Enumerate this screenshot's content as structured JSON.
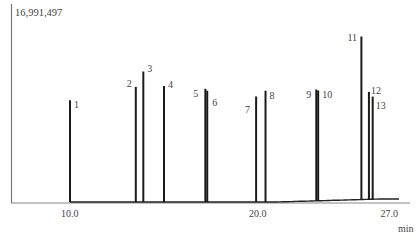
{
  "chart_data": {
    "type": "line",
    "title": "",
    "xlabel": "min",
    "ylabel": "",
    "y_max_label": "16,991,497",
    "xlim": [
      6.9,
      27.8
    ],
    "ylim": [
      0,
      16991497
    ],
    "grid": false,
    "legend": null,
    "x_ticks": [
      {
        "value": 10.0,
        "label": "10.0"
      },
      {
        "value": 20.0,
        "label": "20.0"
      },
      {
        "value": 27.0,
        "label": "27.0"
      }
    ],
    "peaks": [
      {
        "label": "1",
        "rt": 10.0,
        "height": 10600000
      },
      {
        "label": "2",
        "rt": 13.5,
        "height": 12000000
      },
      {
        "label": "3",
        "rt": 13.9,
        "height": 13600000
      },
      {
        "label": "4",
        "rt": 15.0,
        "height": 12100000
      },
      {
        "label": "5",
        "rt": 17.2,
        "height": 11800000
      },
      {
        "label": "6",
        "rt": 17.3,
        "height": 11600000
      },
      {
        "label": "7",
        "rt": 19.9,
        "height": 11000000
      },
      {
        "label": "8",
        "rt": 20.4,
        "height": 11600000
      },
      {
        "label": "9",
        "rt": 23.1,
        "height": 11600000
      },
      {
        "label": "10",
        "rt": 23.2,
        "height": 11500000
      },
      {
        "label": "11",
        "rt": 25.5,
        "height": 16991497
      },
      {
        "label": "12",
        "rt": 25.9,
        "height": 11200000
      },
      {
        "label": "13",
        "rt": 26.1,
        "height": 10700000
      }
    ]
  }
}
